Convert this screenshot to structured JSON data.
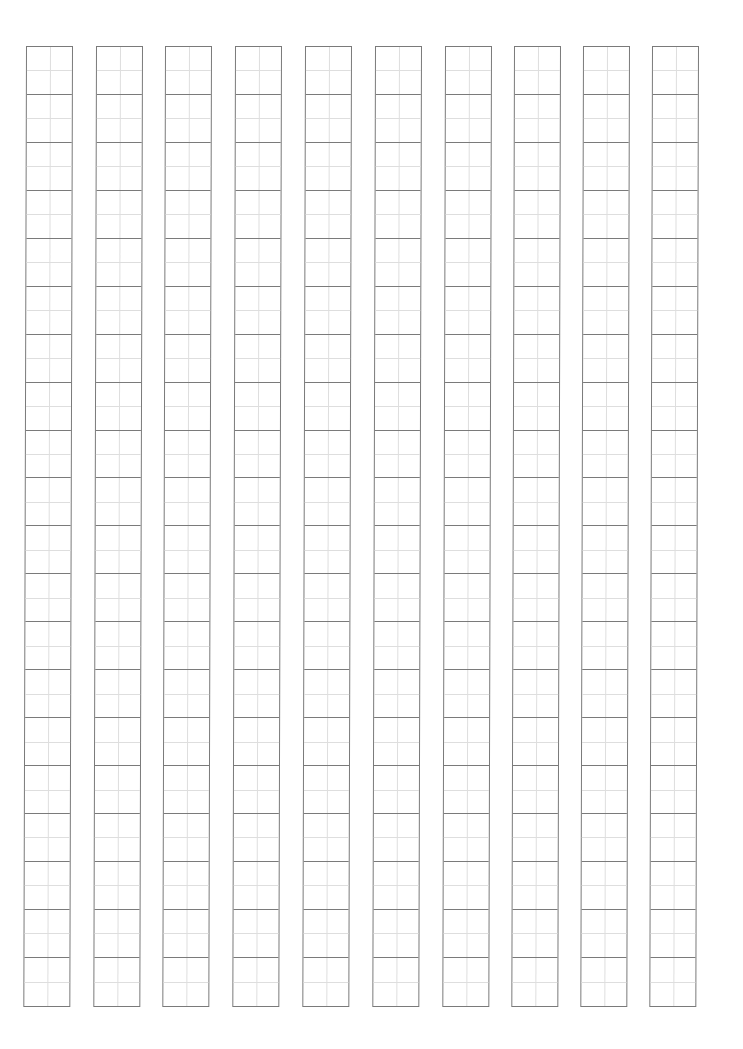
{
  "document": {
    "type": "tianzige-practice-sheet",
    "columns": 10,
    "rows_per_column": 20,
    "column_left_positions": [
      26,
      96,
      165,
      235,
      305,
      375,
      445,
      514,
      583,
      652
    ],
    "colors": {
      "outer_line": "#7a7a7a",
      "guide_line": "#dedede",
      "background": "#ffffff"
    }
  }
}
